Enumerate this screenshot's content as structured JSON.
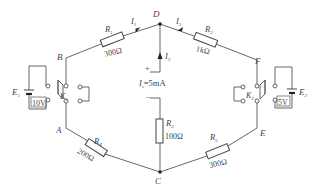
{
  "diagram": {
    "title": "",
    "nodes": {
      "A": "A",
      "B": "B",
      "C": "C",
      "D": "D",
      "E": "E",
      "F": "F"
    },
    "resistors": [
      {
        "id": "R1",
        "symbol": "R",
        "sub": "1",
        "value": "300Ω",
        "between": [
          "B",
          "D"
        ]
      },
      {
        "id": "R2",
        "symbol": "R",
        "sub": "2",
        "value": "1kΩ",
        "between": [
          "D",
          "F"
        ]
      },
      {
        "id": "R3",
        "symbol": "R",
        "sub": "3",
        "value": "100Ω",
        "between": [
          "D",
          "C"
        ]
      },
      {
        "id": "R4",
        "symbol": "R",
        "sub": "4",
        "value": "200Ω",
        "between": [
          "A",
          "C"
        ]
      },
      {
        "id": "R5",
        "symbol": "R",
        "sub": "5",
        "value": "300Ω",
        "between": [
          "C",
          "E"
        ]
      }
    ],
    "currents": [
      {
        "symbol": "I",
        "sub": "1",
        "direction": "B→D"
      },
      {
        "symbol": "I",
        "sub": "2",
        "direction": "F→D"
      },
      {
        "symbol": "I",
        "sub": "3",
        "direction": "up into D"
      }
    ],
    "current_source": {
      "symbol": "I",
      "sub": "s",
      "equation": "=5mA",
      "plus": "+",
      "minus": "−"
    },
    "sources": [
      {
        "id": "E1",
        "symbol": "E",
        "sub": "1",
        "value": "10V"
      },
      {
        "id": "E2",
        "symbol": "E",
        "sub": "2",
        "value": "5V"
      }
    ],
    "switches": [
      {
        "id": "K1",
        "symbol": "K",
        "sub": "1"
      },
      {
        "id": "K2",
        "symbol": "K",
        "sub": "2"
      }
    ]
  }
}
